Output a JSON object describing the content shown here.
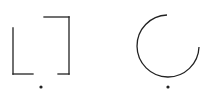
{
  "canvas": {
    "width": 210,
    "height": 93,
    "background": "#ffffff"
  },
  "stroke_color": "#222222",
  "shapes": [
    {
      "name": "open-square-bracket-shape",
      "type": "broken-rectangle",
      "segments": [
        {
          "x1": 13,
          "y1": 28,
          "x2": 13,
          "y2": 74
        },
        {
          "x1": 13,
          "y1": 74,
          "x2": 33,
          "y2": 74
        },
        {
          "x1": 44,
          "y1": 17,
          "x2": 69,
          "y2": 17
        },
        {
          "x1": 69,
          "y1": 17,
          "x2": 69,
          "y2": 74
        },
        {
          "x1": 58,
          "y1": 74,
          "x2": 69,
          "y2": 74
        }
      ],
      "dot": {
        "cx": 41,
        "cy": 87,
        "r": 1.6
      }
    },
    {
      "name": "open-circle-arc-shape",
      "type": "arc",
      "center": {
        "cx": 168,
        "cy": 46
      },
      "radius": 31,
      "path": "M 167 15 A 31 31 0 1 0 199 47",
      "dot": {
        "cx": 168,
        "cy": 87,
        "r": 1.6
      }
    }
  ]
}
